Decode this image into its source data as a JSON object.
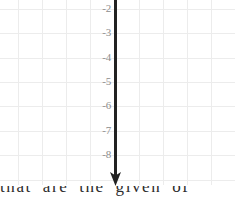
{
  "figure": {
    "width": 235,
    "height": 201,
    "background_color": "#ffffff"
  },
  "bottom_caption": {
    "text": "that are the given of",
    "note": "cut-off partial text row at bottom edge"
  },
  "chart_data": {
    "type": "line",
    "title": "",
    "subtitle": "",
    "xlabel": "",
    "ylabel": "",
    "grid": true,
    "grid_color": "#ececec",
    "grid_spacing_px": 24.5,
    "legend": false,
    "axis_color": "#222222",
    "tick_label_color": "#8c8c8c",
    "y_axis": {
      "name": "vertical-axis",
      "visible": true,
      "arrow": "down",
      "x_position_px": 115,
      "tick_labels": [
        "-2",
        "-3",
        "-4",
        "-5",
        "-6",
        "-7",
        "-8"
      ],
      "tick_values": [
        -2,
        -3,
        -4,
        -5,
        -6,
        -7,
        -8
      ],
      "tick_y_px": [
        9,
        33,
        58,
        82,
        106,
        131,
        155
      ],
      "ylim": [
        -8.9,
        -1.7
      ]
    },
    "x_axis": {
      "name": "horizontal-axis",
      "visible": false,
      "tick_labels": [],
      "gridline_x_px": [
        18,
        42,
        66,
        90,
        139,
        163,
        187,
        211
      ]
    },
    "series": [],
    "values": [],
    "categories": []
  }
}
